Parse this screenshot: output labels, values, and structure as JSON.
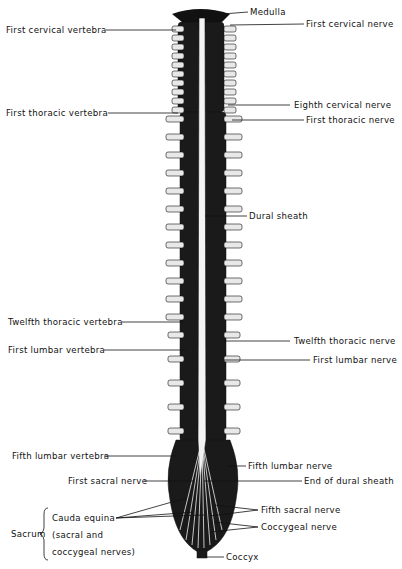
{
  "diagram": {
    "labels_left": [
      {
        "id": "first-cervical-vertebra",
        "text": "First cervical vertebra",
        "x": 6,
        "y": 26
      },
      {
        "id": "first-thoracic-vertebra",
        "text": "First thoracic vertebra",
        "x": 6,
        "y": 109
      },
      {
        "id": "twelfth-thoracic-vertebra",
        "text": "Twelfth thoracic vertebra",
        "x": 8,
        "y": 318
      },
      {
        "id": "first-lumbar-vertebra",
        "text": "First lumbar vertebra",
        "x": 8,
        "y": 346
      },
      {
        "id": "fifth-lumbar-vertebra",
        "text": "Fifth lumbar vertebra",
        "x": 12,
        "y": 452
      },
      {
        "id": "first-sacral-nerve",
        "text": "First sacral nerve",
        "x": 68,
        "y": 478
      },
      {
        "id": "cauda-equina-1",
        "text": "Cauda equina",
        "x": 52,
        "y": 514
      },
      {
        "id": "cauda-equina-2",
        "text": "(sacral and",
        "x": 52,
        "y": 531
      },
      {
        "id": "cauda-equina-3",
        "text": "coccygeal nerves)",
        "x": 52,
        "y": 548
      },
      {
        "id": "sacrum",
        "text": "Sacrum",
        "x": 11,
        "y": 531
      }
    ],
    "labels_right": [
      {
        "id": "medulla",
        "text": "Medulla",
        "x": 250,
        "y": 8
      },
      {
        "id": "first-cervical-nerve",
        "text": "First cervical nerve",
        "x": 306,
        "y": 20
      },
      {
        "id": "eighth-cervical-nerve",
        "text": "Eighth cervical nerve",
        "x": 294,
        "y": 100
      },
      {
        "id": "first-thoracic-nerve",
        "text": "First thoracic nerve",
        "x": 306,
        "y": 116
      },
      {
        "id": "dural-sheath",
        "text": "Dural sheath",
        "x": 249,
        "y": 212
      },
      {
        "id": "twelfth-thoracic-nerve",
        "text": "Twelfth thoracic nerve",
        "x": 294,
        "y": 337
      },
      {
        "id": "first-lumbar-nerve",
        "text": "First lumbar nerve",
        "x": 313,
        "y": 356
      },
      {
        "id": "fifth-lumbar-nerve",
        "text": "Fifth lumbar nerve",
        "x": 248,
        "y": 462
      },
      {
        "id": "end-of-dural-sheath",
        "text": "End of dural sheath",
        "x": 304,
        "y": 477
      },
      {
        "id": "fifth-sacral-nerve",
        "text": "Fifth sacral nerve",
        "x": 261,
        "y": 506
      },
      {
        "id": "coccygeal-nerve",
        "text": "Coccygeal nerve",
        "x": 261,
        "y": 523
      },
      {
        "id": "coccyx",
        "text": "Coccyx",
        "x": 226,
        "y": 553
      }
    ]
  }
}
